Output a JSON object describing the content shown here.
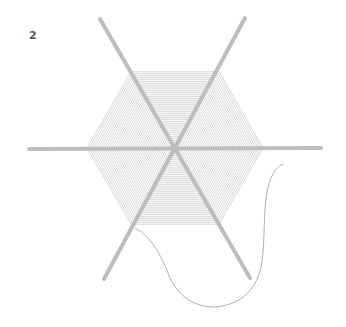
{
  "figure": {
    "step_number": "2",
    "colors": {
      "spoke": "#bdbdbd",
      "weave": "#c4c4c4",
      "thread": "#9a9a9a",
      "label": "#555555"
    }
  }
}
